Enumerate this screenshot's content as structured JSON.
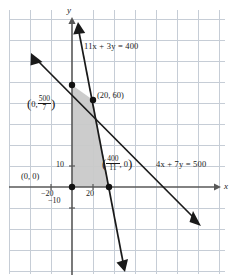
{
  "figure": {
    "type": "cartesian-graph",
    "axes": {
      "x_label": "x",
      "y_label": "y"
    },
    "tick_labels": {
      "x_neg": "−20",
      "x_pos": "20",
      "y_pos": "10",
      "y_neg": "−10"
    },
    "lines": [
      {
        "id": "line1",
        "label": "11x + 3y = 400",
        "coef_x": 11,
        "coef_y": 3,
        "rhs": 400
      },
      {
        "id": "line2",
        "label": "4x + 7y = 500",
        "coef_x": 4,
        "coef_y": 7,
        "rhs": 500
      }
    ],
    "points": [
      {
        "id": "origin",
        "label": "(0, 0)",
        "x": 0,
        "y": 0,
        "dot": true
      },
      {
        "id": "y-intercept",
        "label_prefix": "0,",
        "label_num": "500",
        "label_den": "7",
        "x": 0,
        "y": 71.43,
        "dot": true
      },
      {
        "id": "intersection",
        "label": "(20, 60)",
        "x": 20,
        "y": 60,
        "dot": true
      },
      {
        "id": "x-intercept",
        "label_num": "400",
        "label_den": "11",
        "label_suffix": ", 0",
        "x": 36.36,
        "y": 0,
        "dot": true
      }
    ],
    "shaded_region": {
      "description": "feasible region triangle",
      "fill": "#c9c9c9",
      "vertices": [
        [
          0,
          0
        ],
        [
          0,
          71.43
        ],
        [
          20,
          60
        ],
        [
          36.36,
          0
        ]
      ]
    },
    "grid": {
      "visible": true,
      "color": "#c6cdd6",
      "spacing": 21
    },
    "colors": {
      "line": "#1a1a1a",
      "axis": "#585858",
      "background": "#ffffff"
    }
  }
}
